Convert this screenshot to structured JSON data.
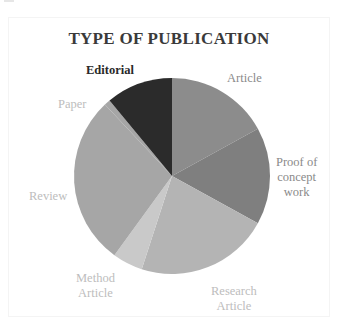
{
  "chart_data": {
    "type": "pie",
    "title": "TYPE OF PUBLICATION",
    "start_angle_deg": 0,
    "direction": "clockwise",
    "categories": [
      "Article",
      "Proof of concept work",
      "Research Article",
      "Method Article",
      "Review",
      "Paper",
      "Editorial"
    ],
    "values": [
      17,
      16,
      22,
      5,
      28,
      1,
      11
    ],
    "colors": [
      "#8c8c8c",
      "#7f7f7f",
      "#b4b4b4",
      "#c9c9c9",
      "#a6a6a6",
      "#a6a6a6",
      "#2b2b2b"
    ],
    "legend": "none (direct labels)",
    "labels": {
      "article": "Article",
      "proof_line1": "Proof of",
      "proof_line2": "concept",
      "proof_line3": "work",
      "research_line1": "Research",
      "research_line2": "Article",
      "method_line1": "Method",
      "method_line2": "Article",
      "review": "Review",
      "paper": "Paper",
      "editorial": "Editorial"
    }
  }
}
